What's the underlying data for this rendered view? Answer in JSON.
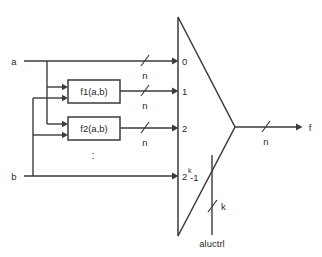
{
  "diagram": {
    "type": "block-diagram",
    "colors": {
      "line": "#3b3b3b",
      "text": "#2b2b2b",
      "background": "#ffffff"
    },
    "inputs": [
      {
        "id": "a",
        "label": "a"
      },
      {
        "id": "b",
        "label": "b"
      }
    ],
    "function_blocks": [
      {
        "id": "f1",
        "label": "f1(a,b)"
      },
      {
        "id": "f2",
        "label": "f2(a,b)"
      }
    ],
    "vertical_ellipsis": ":",
    "bus_widths": {
      "a_to_mux": "n",
      "f1_to_mux": "n",
      "f2_to_mux": "n",
      "output": "n",
      "control": "k"
    },
    "mux": {
      "name": "multiplexer",
      "port_labels": [
        {
          "id": "port-0",
          "text": "0"
        },
        {
          "id": "port-1",
          "text": "1"
        },
        {
          "id": "port-2",
          "text": "2"
        },
        {
          "id": "port-last",
          "base": "2",
          "exponent": "k",
          "suffix": "-1"
        }
      ],
      "control_label": "aluctrl",
      "control_width_label": "k"
    },
    "output": {
      "label": "f",
      "width_label": "n"
    }
  }
}
